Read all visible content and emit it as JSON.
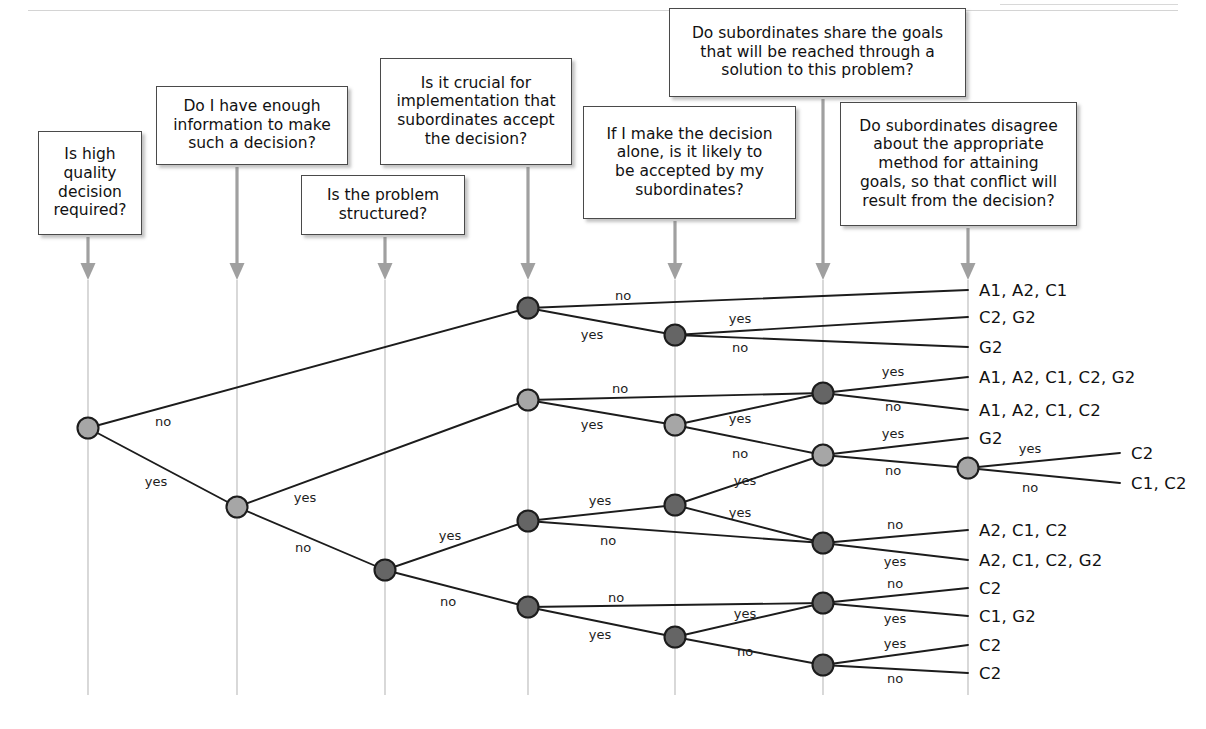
{
  "diagram": {
    "type": "decision-tree",
    "colors": {
      "node_dark": "#656565",
      "node_light": "#a6a6a6",
      "node_stroke": "#1c1c1c",
      "edge": "#1c1c1c",
      "axis_line": "#b9b9b9",
      "arrow": "#a0a0a0",
      "box_border": "#4a4a4a"
    },
    "questions": [
      {
        "id": "q1",
        "label": "Is high\nquality\ndecision\nrequired?",
        "text": "Is high quality decision required?",
        "axis_x": 88
      },
      {
        "id": "q2",
        "label": "Do I have enough\ninformation to make\nsuch a decision?",
        "text": "Do I have enough information to make such a decision?",
        "axis_x": 237
      },
      {
        "id": "q3",
        "label": "Is the problem\nstructured?",
        "text": "Is the problem structured?",
        "axis_x": 385
      },
      {
        "id": "q4",
        "label": "Is it crucial for\nimplementation that\nsubordinates accept\nthe decision?",
        "text": "Is it crucial for implementation that subordinates accept the decision?",
        "axis_x": 528
      },
      {
        "id": "q5",
        "label": "If I make the decision\nalone, is it likely to\nbe accepted by my\nsubordinates?",
        "text": "If I make the decision alone, is it likely to be accepted by my subordinates?",
        "axis_x": 675
      },
      {
        "id": "q6",
        "label": "Do subordinates share the goals\nthat will be reached through a\nsolution to this problem?",
        "text": "Do subordinates share the goals that will be reached through a solution to this problem?",
        "axis_x": 823
      },
      {
        "id": "q7",
        "label": "Do subordinates disagree\nabout the appropriate\nmethod for attaining\ngoals, so that conflict will\nresult from the decision?",
        "text": "Do subordinates disagree about the appropriate method for attaining goals, so that conflict will result from the decision?",
        "axis_x": 968
      }
    ],
    "boxes": [
      {
        "q": 0,
        "x": 38,
        "y": 131,
        "w": 104,
        "h": 104,
        "lines": [
          "Is high",
          "quality",
          "decision",
          "required?"
        ]
      },
      {
        "q": 1,
        "x": 156,
        "y": 86,
        "w": 192,
        "h": 79,
        "lines": [
          "Do I have enough",
          "information to make",
          "such a decision?"
        ]
      },
      {
        "q": 2,
        "x": 301,
        "y": 175,
        "w": 164,
        "h": 60,
        "lines": [
          "Is the problem",
          "structured?"
        ]
      },
      {
        "q": 3,
        "x": 380,
        "y": 58,
        "w": 192,
        "h": 107,
        "lines": [
          "Is it crucial for",
          "implementation that",
          "subordinates accept",
          "the decision?"
        ]
      },
      {
        "q": 4,
        "x": 583,
        "y": 106,
        "w": 213,
        "h": 113,
        "lines": [
          "If I make the decision",
          "alone, is it likely to",
          "be accepted by my",
          "subordinates?"
        ]
      },
      {
        "q": 5,
        "x": 669,
        "y": 8,
        "w": 297,
        "h": 89,
        "lines": [
          "Do subordinates share the goals",
          "that will be reached through a",
          "solution to this problem?"
        ]
      },
      {
        "q": 6,
        "x": 840,
        "y": 102,
        "w": 237,
        "h": 124,
        "lines": [
          "Do subordinates disagree",
          "about the appropriate",
          "method for attaining",
          "goals, so that conflict will",
          "result from the decision?"
        ]
      }
    ],
    "axes": [
      {
        "x": 88,
        "box_bottom": 235,
        "arrow_y": 280,
        "line_top": 280,
        "line_bottom": 695
      },
      {
        "x": 237,
        "box_bottom": 165,
        "arrow_y": 280,
        "line_top": 280,
        "line_bottom": 695
      },
      {
        "x": 385,
        "box_bottom": 235,
        "arrow_y": 280,
        "line_top": 280,
        "line_bottom": 695
      },
      {
        "x": 528,
        "box_bottom": 165,
        "arrow_y": 280,
        "line_top": 280,
        "line_bottom": 695
      },
      {
        "x": 675,
        "box_bottom": 219,
        "arrow_y": 280,
        "line_top": 280,
        "line_bottom": 695
      },
      {
        "x": 823,
        "box_bottom": 97,
        "arrow_y": 280,
        "line_top": 280,
        "line_bottom": 695
      },
      {
        "x": 968,
        "box_bottom": 226,
        "arrow_y": 280,
        "line_top": 280,
        "line_bottom": 695
      }
    ],
    "nodes": [
      {
        "id": "n1",
        "x": 88,
        "y": 428,
        "shade": "light"
      },
      {
        "id": "n2",
        "x": 237,
        "y": 507,
        "shade": "light"
      },
      {
        "id": "n3",
        "x": 385,
        "y": 570,
        "shade": "dark"
      },
      {
        "id": "n4",
        "x": 528,
        "y": 308,
        "shade": "dark"
      },
      {
        "id": "n5",
        "x": 528,
        "y": 400,
        "shade": "light"
      },
      {
        "id": "n6",
        "x": 528,
        "y": 521,
        "shade": "dark"
      },
      {
        "id": "n7",
        "x": 528,
        "y": 607,
        "shade": "dark"
      },
      {
        "id": "n8",
        "x": 675,
        "y": 335,
        "shade": "dark"
      },
      {
        "id": "n9",
        "x": 675,
        "y": 425,
        "shade": "light"
      },
      {
        "id": "n10",
        "x": 675,
        "y": 505,
        "shade": "dark"
      },
      {
        "id": "n11",
        "x": 675,
        "y": 637,
        "shade": "dark"
      },
      {
        "id": "n12",
        "x": 823,
        "y": 393,
        "shade": "dark"
      },
      {
        "id": "n13",
        "x": 823,
        "y": 455,
        "shade": "light"
      },
      {
        "id": "n14",
        "x": 823,
        "y": 543,
        "shade": "dark"
      },
      {
        "id": "n15",
        "x": 823,
        "y": 603,
        "shade": "dark"
      },
      {
        "id": "n16",
        "x": 823,
        "y": 665,
        "shade": "dark"
      },
      {
        "id": "n17",
        "x": 968,
        "y": 468,
        "shade": "light"
      }
    ],
    "edges": [
      {
        "from": [
          88,
          428
        ],
        "to": [
          528,
          308
        ],
        "label": "no",
        "lx": 163,
        "ly": 421
      },
      {
        "from": [
          88,
          428
        ],
        "to": [
          237,
          507
        ],
        "label": "yes",
        "lx": 156,
        "ly": 481
      },
      {
        "from": [
          237,
          507
        ],
        "to": [
          528,
          400
        ],
        "label": "yes",
        "lx": 305,
        "ly": 497
      },
      {
        "from": [
          237,
          507
        ],
        "to": [
          385,
          570
        ],
        "label": "no",
        "lx": 303,
        "ly": 547
      },
      {
        "from": [
          385,
          570
        ],
        "to": [
          528,
          521
        ],
        "label": "yes",
        "lx": 450,
        "ly": 535
      },
      {
        "from": [
          385,
          570
        ],
        "to": [
          528,
          607
        ],
        "label": "no",
        "lx": 448,
        "ly": 601
      },
      {
        "from": [
          528,
          308
        ],
        "to": [
          968,
          290
        ],
        "label": "no",
        "lx": 623,
        "ly": 295
      },
      {
        "from": [
          528,
          308
        ],
        "to": [
          675,
          335
        ],
        "label": "yes",
        "lx": 592,
        "ly": 334
      },
      {
        "from": [
          675,
          335
        ],
        "to": [
          968,
          317
        ],
        "label": "yes",
        "lx": 740,
        "ly": 318
      },
      {
        "from": [
          675,
          335
        ],
        "to": [
          968,
          347
        ],
        "label": "no",
        "lx": 740,
        "ly": 347
      },
      {
        "from": [
          528,
          400
        ],
        "to": [
          823,
          393
        ],
        "label": "no",
        "lx": 620,
        "ly": 388
      },
      {
        "from": [
          528,
          400
        ],
        "to": [
          675,
          425
        ],
        "label": "yes",
        "lx": 592,
        "ly": 424
      },
      {
        "from": [
          823,
          393
        ],
        "to": [
          968,
          377
        ],
        "label": "yes",
        "lx": 893,
        "ly": 371
      },
      {
        "from": [
          823,
          393
        ],
        "to": [
          968,
          410
        ],
        "label": "no",
        "lx": 893,
        "ly": 406
      },
      {
        "from": [
          675,
          425
        ],
        "to": [
          823,
          393
        ],
        "label": "yes",
        "lx": 740,
        "ly": 418
      },
      {
        "from": [
          675,
          425
        ],
        "to": [
          823,
          455
        ],
        "label": "no",
        "lx": 740,
        "ly": 453
      },
      {
        "from": [
          823,
          455
        ],
        "to": [
          968,
          438
        ],
        "label": "yes",
        "lx": 893,
        "ly": 433
      },
      {
        "from": [
          823,
          455
        ],
        "to": [
          968,
          468
        ],
        "label": "no",
        "lx": 893,
        "ly": 470
      },
      {
        "from": [
          968,
          468
        ],
        "to": [
          1120,
          453
        ],
        "label": "yes",
        "lx": 1030,
        "ly": 448
      },
      {
        "from": [
          968,
          468
        ],
        "to": [
          1120,
          483
        ],
        "label": "no",
        "lx": 1030,
        "ly": 487
      },
      {
        "from": [
          528,
          521
        ],
        "to": [
          675,
          505
        ],
        "label": "yes",
        "lx": 600,
        "ly": 500
      },
      {
        "from": [
          528,
          521
        ],
        "to": [
          823,
          543
        ],
        "label": "no",
        "lx": 608,
        "ly": 540
      },
      {
        "from": [
          675,
          505
        ],
        "to": [
          823,
          455
        ],
        "label": "yes",
        "lx": 745,
        "ly": 480
      },
      {
        "from": [
          675,
          505
        ],
        "to": [
          823,
          543
        ],
        "label": "yes",
        "lx": 740,
        "ly": 512
      },
      {
        "from": [
          823,
          543
        ],
        "to": [
          968,
          530
        ],
        "label": "no",
        "lx": 895,
        "ly": 524
      },
      {
        "from": [
          823,
          543
        ],
        "to": [
          968,
          560
        ],
        "label": "yes",
        "lx": 895,
        "ly": 561
      },
      {
        "from": [
          528,
          607
        ],
        "to": [
          823,
          603
        ],
        "label": "no",
        "lx": 616,
        "ly": 597
      },
      {
        "from": [
          528,
          607
        ],
        "to": [
          675,
          637
        ],
        "label": "yes",
        "lx": 600,
        "ly": 634
      },
      {
        "from": [
          675,
          637
        ],
        "to": [
          823,
          603
        ],
        "label": "yes",
        "lx": 745,
        "ly": 613
      },
      {
        "from": [
          675,
          637
        ],
        "to": [
          823,
          665
        ],
        "label": "no",
        "lx": 745,
        "ly": 651
      },
      {
        "from": [
          823,
          603
        ],
        "to": [
          968,
          588
        ],
        "label": "no",
        "lx": 895,
        "ly": 583
      },
      {
        "from": [
          823,
          603
        ],
        "to": [
          968,
          616
        ],
        "label": "yes",
        "lx": 895,
        "ly": 618
      },
      {
        "from": [
          823,
          665
        ],
        "to": [
          968,
          645
        ],
        "label": "yes",
        "lx": 895,
        "ly": 643
      },
      {
        "from": [
          823,
          665
        ],
        "to": [
          968,
          673
        ],
        "label": "no",
        "lx": 895,
        "ly": 678
      }
    ],
    "outcomes": [
      {
        "text": "A1, A2, C1",
        "x": 979,
        "y": 290
      },
      {
        "text": "C2, G2",
        "x": 979,
        "y": 317
      },
      {
        "text": "G2",
        "x": 979,
        "y": 347
      },
      {
        "text": "A1, A2, C1, C2, G2",
        "x": 979,
        "y": 377
      },
      {
        "text": "A1, A2, C1, C2",
        "x": 979,
        "y": 410
      },
      {
        "text": "G2",
        "x": 979,
        "y": 438
      },
      {
        "text": "C2",
        "x": 1131,
        "y": 453
      },
      {
        "text": "C1, C2",
        "x": 1131,
        "y": 483
      },
      {
        "text": "A2, C1, C2",
        "x": 979,
        "y": 530
      },
      {
        "text": "A2, C1, C2, G2",
        "x": 979,
        "y": 560
      },
      {
        "text": "C2",
        "x": 979,
        "y": 588
      },
      {
        "text": "C1, G2",
        "x": 979,
        "y": 616
      },
      {
        "text": "C2",
        "x": 979,
        "y": 645
      },
      {
        "text": "C2",
        "x": 979,
        "y": 673
      }
    ]
  }
}
